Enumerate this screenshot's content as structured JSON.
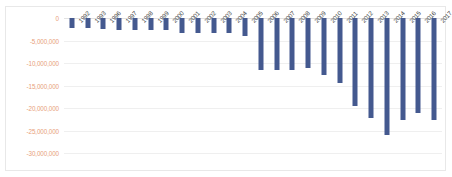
{
  "chart_data": {
    "type": "bar",
    "title": "",
    "xlabel": "",
    "ylabel": "",
    "orientation": "vertical",
    "bars_direction": "downward",
    "grid": true,
    "legend": false,
    "ylim": [
      -30000000,
      0
    ],
    "ytick_step": 5000000,
    "yticks": [
      0,
      -5000000,
      -10000000,
      -15000000,
      -20000000,
      -25000000,
      -30000000
    ],
    "ytick_labels": [
      "0",
      "-5,000,000",
      "-10,000,000",
      "-15,000,000",
      "-20,000,000",
      "-25,000,000",
      "-30,000,000"
    ],
    "categories": [
      "1992",
      "1993",
      "1996",
      "1997",
      "1998",
      "1999",
      "2000",
      "2001",
      "2002",
      "2003",
      "2004",
      "2005",
      "2006",
      "2007",
      "2008",
      "2009",
      "2010",
      "2011",
      "2012",
      "2013",
      "2014",
      "2015",
      "2016",
      "2017"
    ],
    "values": [
      -2200000,
      -2200000,
      -2400000,
      -2600000,
      -2600000,
      -2600000,
      -2600000,
      -3300000,
      -3300000,
      -3300000,
      -3300000,
      -4000000,
      -11500000,
      -11500000,
      -11500000,
      -11000000,
      -12700000,
      -14500000,
      -19500000,
      -22200000,
      -26000000,
      -22700000,
      -21000000,
      -22700000
    ],
    "series": [
      {
        "name": "series1",
        "color": "#44598F",
        "values": [
          -2200000,
          -2200000,
          -2400000,
          -2600000,
          -2600000,
          -2600000,
          -2600000,
          -3300000,
          -3300000,
          -3300000,
          -3300000,
          -4000000,
          -11500000,
          -11500000,
          -11500000,
          -11000000,
          -12700000,
          -14500000,
          -19500000,
          -22200000,
          -26000000,
          -22700000,
          -21000000,
          -22700000
        ]
      }
    ],
    "colors": {
      "bar": "#44598F",
      "gridline": "#efefef",
      "zero_line": "#e2e2e2",
      "ytick_label": "#e8a07a",
      "xtick_label": "#3b3b3b",
      "plot_background": "#ffffff",
      "border": "#e8e8e8"
    }
  }
}
